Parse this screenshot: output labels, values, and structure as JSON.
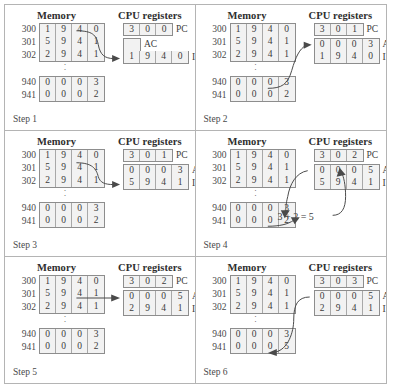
{
  "labels": {
    "memory_header": "Memory",
    "cpu_header": "CPU registers",
    "pc": "PC",
    "ac": "AC",
    "ir": "IR"
  },
  "addresses": {
    "a300": "300",
    "a301": "301",
    "a302": "302",
    "a940": "940",
    "a941": "941"
  },
  "panels": [
    {
      "step_label": "Step 1",
      "memory": {
        "rows": [
          {
            "addr": "300",
            "digits": [
              "1",
              "9",
              "4",
              "0"
            ]
          },
          {
            "addr": "301",
            "digits": [
              "5",
              "9",
              "4",
              "1"
            ]
          },
          {
            "addr": "302",
            "digits": [
              "2",
              "9",
              "4",
              "1"
            ]
          }
        ],
        "rows2": [
          {
            "addr": "940",
            "digits": [
              "0",
              "0",
              "0",
              "3"
            ]
          },
          {
            "addr": "941",
            "digits": [
              "0",
              "0",
              "0",
              "2"
            ]
          }
        ]
      },
      "registers": {
        "pc": [
          "3",
          "0",
          "0"
        ],
        "ac": [],
        "ir": [
          "1",
          "9",
          "4",
          "0"
        ]
      },
      "equation": ""
    },
    {
      "step_label": "Step 2",
      "memory": {
        "rows": [
          {
            "addr": "300",
            "digits": [
              "1",
              "9",
              "4",
              "0"
            ]
          },
          {
            "addr": "301",
            "digits": [
              "5",
              "9",
              "4",
              "1"
            ]
          },
          {
            "addr": "302",
            "digits": [
              "2",
              "9",
              "4",
              "1"
            ]
          }
        ],
        "rows2": [
          {
            "addr": "940",
            "digits": [
              "0",
              "0",
              "0",
              "3"
            ]
          },
          {
            "addr": "941",
            "digits": [
              "0",
              "0",
              "0",
              "2"
            ]
          }
        ]
      },
      "registers": {
        "pc": [
          "3",
          "0",
          "1"
        ],
        "ac": [
          "0",
          "0",
          "0",
          "3"
        ],
        "ir": [
          "1",
          "9",
          "4",
          "0"
        ]
      },
      "equation": ""
    },
    {
      "step_label": "Step 3",
      "memory": {
        "rows": [
          {
            "addr": "300",
            "digits": [
              "1",
              "9",
              "4",
              "0"
            ]
          },
          {
            "addr": "301",
            "digits": [
              "5",
              "9",
              "4",
              "1"
            ]
          },
          {
            "addr": "302",
            "digits": [
              "2",
              "9",
              "4",
              "1"
            ]
          }
        ],
        "rows2": [
          {
            "addr": "940",
            "digits": [
              "0",
              "0",
              "0",
              "3"
            ]
          },
          {
            "addr": "941",
            "digits": [
              "0",
              "0",
              "0",
              "2"
            ]
          }
        ]
      },
      "registers": {
        "pc": [
          "3",
          "0",
          "1"
        ],
        "ac": [
          "0",
          "0",
          "0",
          "3"
        ],
        "ir": [
          "5",
          "9",
          "4",
          "1"
        ]
      },
      "equation": ""
    },
    {
      "step_label": "Step 4",
      "memory": {
        "rows": [
          {
            "addr": "300",
            "digits": [
              "1",
              "9",
              "4",
              "0"
            ]
          },
          {
            "addr": "301",
            "digits": [
              "5",
              "9",
              "4",
              "1"
            ]
          },
          {
            "addr": "302",
            "digits": [
              "2",
              "9",
              "4",
              "1"
            ]
          }
        ],
        "rows2": [
          {
            "addr": "940",
            "digits": [
              "0",
              "0",
              "0",
              "3"
            ]
          },
          {
            "addr": "941",
            "digits": [
              "0",
              "0",
              "0",
              "2"
            ]
          }
        ]
      },
      "registers": {
        "pc": [
          "3",
          "0",
          "2"
        ],
        "ac": [
          "0",
          "0",
          "0",
          "5"
        ],
        "ir": [
          "5",
          "9",
          "4",
          "1"
        ]
      },
      "equation": "3 + 2 = 5"
    },
    {
      "step_label": "Step 5",
      "memory": {
        "rows": [
          {
            "addr": "300",
            "digits": [
              "1",
              "9",
              "4",
              "0"
            ]
          },
          {
            "addr": "301",
            "digits": [
              "5",
              "9",
              "4",
              "1"
            ]
          },
          {
            "addr": "302",
            "digits": [
              "2",
              "9",
              "4",
              "1"
            ]
          }
        ],
        "rows2": [
          {
            "addr": "940",
            "digits": [
              "0",
              "0",
              "0",
              "3"
            ]
          },
          {
            "addr": "941",
            "digits": [
              "0",
              "0",
              "0",
              "2"
            ]
          }
        ]
      },
      "registers": {
        "pc": [
          "3",
          "0",
          "2"
        ],
        "ac": [
          "0",
          "0",
          "0",
          "5"
        ],
        "ir": [
          "2",
          "9",
          "4",
          "1"
        ]
      },
      "equation": ""
    },
    {
      "step_label": "Step 6",
      "memory": {
        "rows": [
          {
            "addr": "300",
            "digits": [
              "1",
              "9",
              "4",
              "0"
            ]
          },
          {
            "addr": "301",
            "digits": [
              "5",
              "9",
              "4",
              "1"
            ]
          },
          {
            "addr": "302",
            "digits": [
              "2",
              "9",
              "4",
              "1"
            ]
          }
        ],
        "rows2": [
          {
            "addr": "940",
            "digits": [
              "0",
              "0",
              "0",
              "3"
            ]
          },
          {
            "addr": "941",
            "digits": [
              "0",
              "0",
              "0",
              "5"
            ]
          }
        ]
      },
      "registers": {
        "pc": [
          "3",
          "0",
          "3"
        ],
        "ac": [
          "0",
          "0",
          "0",
          "5"
        ],
        "ir": [
          "2",
          "9",
          "4",
          "1"
        ]
      },
      "equation": ""
    }
  ],
  "colors": {
    "cell_fill": "#f2f2f2",
    "border": "#8d8d8d",
    "frame": "#b4b4b4",
    "text": "#3b3b3b"
  }
}
